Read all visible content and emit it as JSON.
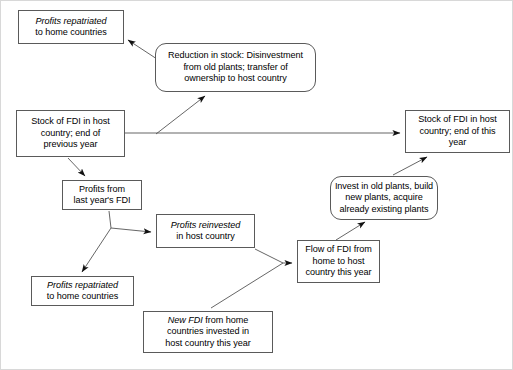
{
  "diagram": {
    "type": "flowchart",
    "background_color": "#ffffff",
    "border_color": "#5a5a5a",
    "text_color": "#000000",
    "nodes": [
      {
        "id": "profits-repatriated-top",
        "name": "profits-repatriated-top",
        "shape": "rect",
        "x": 18,
        "y": 10,
        "w": 106,
        "h": 34,
        "lines": [
          {
            "text": "Profits repatriated",
            "italic": true
          },
          {
            "text": "to home countries",
            "italic": false
          }
        ]
      },
      {
        "id": "reduction-in-stock",
        "name": "reduction-in-stock",
        "shape": "rounded",
        "x": 155,
        "y": 43,
        "w": 161,
        "h": 49,
        "lines": [
          {
            "text": "Reduction in stock: Disinvestment",
            "italic": false
          },
          {
            "text": "from old plants; transfer of",
            "italic": false
          },
          {
            "text": "ownership to host country",
            "italic": false
          }
        ]
      },
      {
        "id": "stock-previous-year",
        "name": "stock-of-fdi-previous-year",
        "shape": "rect",
        "x": 16,
        "y": 110,
        "w": 109,
        "h": 47,
        "lines": [
          {
            "text": "Stock of FDI in host",
            "italic": false
          },
          {
            "text": "country; end of",
            "italic": false
          },
          {
            "text": "previous year",
            "italic": false
          }
        ]
      },
      {
        "id": "stock-this-year",
        "name": "stock-of-fdi-this-year",
        "shape": "rect",
        "x": 405,
        "y": 110,
        "w": 105,
        "h": 43,
        "lines": [
          {
            "text": "Stock of FDI in host",
            "italic": false
          },
          {
            "text": "country; end of this",
            "italic": false
          },
          {
            "text": "year",
            "italic": false
          }
        ]
      },
      {
        "id": "profits-last-year",
        "name": "profits-from-last-years-fdi",
        "shape": "rect",
        "x": 62,
        "y": 180,
        "w": 80,
        "h": 30,
        "lines": [
          {
            "text": "Profits from",
            "italic": false
          },
          {
            "text": "last year's FDI",
            "italic": false
          }
        ]
      },
      {
        "id": "invest-in-plants",
        "name": "invest-in-old-plants",
        "shape": "rounded",
        "x": 330,
        "y": 176,
        "w": 108,
        "h": 44,
        "lines": [
          {
            "text": "Invest in old plants, build",
            "italic": false
          },
          {
            "text": "new plants, acquire",
            "italic": false
          },
          {
            "text": "already existing plants",
            "italic": false
          }
        ]
      },
      {
        "id": "profits-reinvested",
        "name": "profits-reinvested-in-host-country",
        "shape": "rect",
        "x": 156,
        "y": 214,
        "w": 99,
        "h": 34,
        "lines": [
          {
            "text": "Profits reinvested",
            "italic": true
          },
          {
            "text": "in host country",
            "italic": false
          }
        ]
      },
      {
        "id": "flow-of-fdi",
        "name": "flow-of-fdi-home-to-host",
        "shape": "rect",
        "x": 297,
        "y": 240,
        "w": 83,
        "h": 43,
        "lines": [
          {
            "text": "Flow of FDI from",
            "italic": false
          },
          {
            "text": "home to host",
            "italic": false
          },
          {
            "text": "country this year",
            "italic": false
          }
        ]
      },
      {
        "id": "profits-repatriated-bottom",
        "name": "profits-repatriated-bottom",
        "shape": "rect",
        "x": 31,
        "y": 276,
        "w": 103,
        "h": 30,
        "lines": [
          {
            "text": "Profits repatriated",
            "italic": true
          },
          {
            "text": "to home countries",
            "italic": false
          }
        ]
      },
      {
        "id": "new-fdi",
        "name": "new-fdi-from-home-countries",
        "shape": "rect",
        "x": 143,
        "y": 311,
        "w": 130,
        "h": 42,
        "lines": [
          {
            "text": "New FDI",
            "italic": true,
            "suffix": " from home"
          },
          {
            "text": "countries invested in",
            "italic": false
          },
          {
            "text": "host country this year",
            "italic": false
          }
        ]
      }
    ],
    "edges": [
      {
        "name": "edge-reduction-to-profits-repatriated-top",
        "from": "reduction-in-stock",
        "to": "profits-repatriated-top",
        "points": "160,61 128,40",
        "arrow": true
      },
      {
        "name": "edge-stock-previous-to-reduction",
        "from": "stock-of-fdi-previous-year",
        "to": "reduction-in-stock",
        "points": "156,134 205,96",
        "arrow": true
      },
      {
        "name": "edge-stock-previous-to-stock-this-year",
        "from": "stock-of-fdi-previous-year",
        "to": "stock-of-fdi-this-year",
        "points": "125,133 400,133",
        "arrow": true
      },
      {
        "name": "edge-stock-previous-to-profits-last-year",
        "from": "stock-of-fdi-previous-year",
        "to": "profits-from-last-years-fdi",
        "points": "68,158 85,176",
        "arrow": true
      },
      {
        "name": "edge-profits-last-year-fork-to-reinvested",
        "from": "profits-from-last-years-fdi",
        "to": "profits-reinvested-in-host-country",
        "points": "109,211 111,228 151,232",
        "arrow": true
      },
      {
        "name": "edge-profits-last-year-fork-to-repatriated",
        "from": "profits-from-last-years-fdi",
        "to": "profits-repatriated-bottom",
        "points": "111,228 82,272",
        "arrow": true
      },
      {
        "name": "edge-reinvested-to-flow",
        "from": "profits-reinvested-in-host-country",
        "to": "flow-of-fdi-home-to-host",
        "points": "255,249 283,263 292,263",
        "arrow": true
      },
      {
        "name": "edge-new-fdi-to-flow",
        "from": "new-fdi-from-home-countries",
        "to": "flow-of-fdi-home-to-host",
        "points": "211,308 283,263",
        "arrow": false
      },
      {
        "name": "edge-flow-to-invest",
        "from": "flow-of-fdi-home-to-host",
        "to": "invest-in-old-plants",
        "points": "336,240 365,222",
        "arrow": true
      },
      {
        "name": "edge-invest-to-stock-this-year",
        "from": "invest-in-old-plants",
        "to": "stock-of-fdi-this-year",
        "points": "393,175 427,157",
        "arrow": true
      }
    ]
  }
}
